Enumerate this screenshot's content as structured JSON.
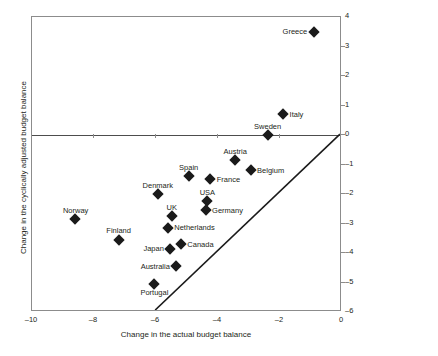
{
  "chart_data": {
    "type": "scatter",
    "title": "",
    "xlabel": "Change in the actual budget balance",
    "ylabel": "Change in the cyclically adjusted budget balance",
    "xlim": [
      -10,
      0
    ],
    "ylim": [
      -6,
      4
    ],
    "xticks": [
      -10,
      -8,
      -6,
      -4,
      -2,
      0
    ],
    "xtick_labels": [
      "–10",
      "–8",
      "–6",
      "–4",
      "–2",
      "0"
    ],
    "yticks": [
      4,
      3,
      2,
      1,
      0,
      -1,
      -2,
      -3,
      -4,
      -5,
      -6
    ],
    "ytick_labels": [
      "4",
      "3",
      "2",
      "1",
      "0",
      "–1",
      "–2",
      "–3",
      "–4",
      "–5",
      "–6"
    ],
    "grid": false,
    "legend": null,
    "marker_shape": "diamond",
    "marker_color": "#1a1a1a",
    "annotations": [
      {
        "type": "line",
        "name": "forty-five-degree-line",
        "x": [
          -6,
          0
        ],
        "y": [
          -6,
          0
        ],
        "color": "#1a1a1a"
      },
      {
        "type": "line",
        "name": "zero-horizontal-line",
        "x": [
          -10,
          0
        ],
        "y": [
          0,
          0
        ],
        "color": "#4d4d4d"
      }
    ],
    "points": [
      {
        "label": "Greece",
        "x": -0.9,
        "y": 3.5,
        "label_pos": "left"
      },
      {
        "label": "Italy",
        "x": -1.9,
        "y": 0.7,
        "label_pos": "right"
      },
      {
        "label": "Sweden",
        "x": -2.4,
        "y": 0.0,
        "label_pos": "above"
      },
      {
        "label": "Austria",
        "x": -3.45,
        "y": -0.85,
        "label_pos": "above"
      },
      {
        "label": "Belgium",
        "x": -2.95,
        "y": -1.2,
        "label_pos": "right"
      },
      {
        "label": "Spain",
        "x": -4.95,
        "y": -1.4,
        "label_pos": "above"
      },
      {
        "label": "France",
        "x": -4.25,
        "y": -1.5,
        "label_pos": "right"
      },
      {
        "label": "Denmark",
        "x": -5.95,
        "y": -2.0,
        "label_pos": "above"
      },
      {
        "label": "USA",
        "x": -4.35,
        "y": -2.25,
        "label_pos": "above"
      },
      {
        "label": "Germany",
        "x": -4.4,
        "y": -2.55,
        "label_pos": "right"
      },
      {
        "label": "UK",
        "x": -5.5,
        "y": -2.75,
        "label_pos": "above"
      },
      {
        "label": "Norway",
        "x": -8.6,
        "y": -2.85,
        "label_pos": "above"
      },
      {
        "label": "Netherlands",
        "x": -5.62,
        "y": -3.15,
        "label_pos": "right"
      },
      {
        "label": "Finland",
        "x": -7.2,
        "y": -3.55,
        "label_pos": "above"
      },
      {
        "label": "Canada",
        "x": -5.2,
        "y": -3.7,
        "label_pos": "right"
      },
      {
        "label": "Japan",
        "x": -5.55,
        "y": -3.85,
        "label_pos": "left"
      },
      {
        "label": "Australia",
        "x": -5.35,
        "y": -4.45,
        "label_pos": "left"
      },
      {
        "label": "Portugal",
        "x": -6.05,
        "y": -5.05,
        "label_pos": "below"
      }
    ]
  }
}
